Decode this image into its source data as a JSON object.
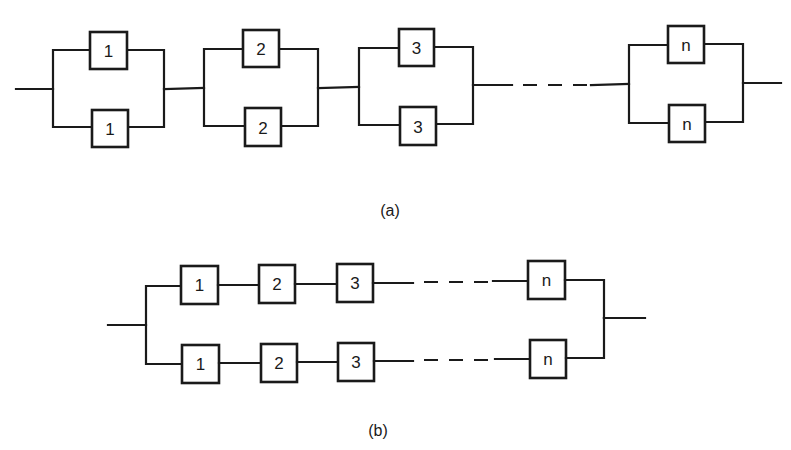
{
  "diagram_a": {
    "caption": "(a)",
    "description": "Series connection of n parallel pairs of components",
    "stages": [
      {
        "top": "1",
        "bottom": "1"
      },
      {
        "top": "2",
        "bottom": "2"
      },
      {
        "top": "3",
        "bottom": "3"
      },
      {
        "top": "n",
        "bottom": "n"
      }
    ]
  },
  "diagram_b": {
    "caption": "(b)",
    "description": "Parallel connection of two series chains of n components",
    "branches": [
      {
        "components": [
          "1",
          "2",
          "3",
          "n"
        ]
      },
      {
        "components": [
          "1",
          "2",
          "3",
          "n"
        ]
      }
    ]
  },
  "colors": {
    "line": "#1a1a1a",
    "background": "#ffffff"
  }
}
